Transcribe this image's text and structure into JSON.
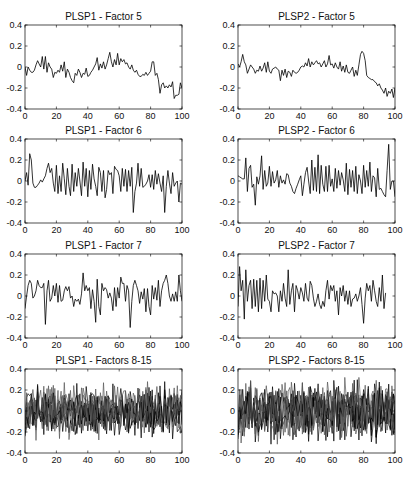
{
  "figure": {
    "layout": {
      "rows": 4,
      "cols": 2
    },
    "line_color": "#000000",
    "axis_color": "#000000"
  },
  "chart_data": [
    {
      "type": "line",
      "title": "PLSP1 - Factor 5",
      "xlabel": "",
      "ylabel": "",
      "xlim": [
        0,
        100
      ],
      "ylim": [
        -0.4,
        0.4
      ],
      "xticks": [
        0,
        20,
        40,
        60,
        80,
        100
      ],
      "yticks": [
        0.4,
        0.2,
        0,
        -0.2,
        -0.4
      ],
      "grid": false,
      "series": [
        {
          "name": "Factor 5",
          "x_step": 1,
          "values": [
            0,
            -0.08,
            0,
            -0.03,
            -0.05,
            -0.05,
            -0.03,
            0.02,
            0.06,
            0.03,
            0,
            0.1,
            -0.02,
            0.1,
            -0.05,
            0.04,
            0,
            -0.02,
            -0.1,
            -0.05,
            -0.06,
            -0.03,
            -0.05,
            0.02,
            -0.04,
            0.05,
            -0.1,
            -0.02,
            -0.05,
            -0.1,
            -0.13,
            -0.15,
            -0.06,
            -0.08,
            -0.02,
            -0.05,
            -0.1,
            -0.06,
            -0.07,
            -0.01,
            -0.09,
            -0.08,
            -0.05,
            -0.03,
            0,
            0.03,
            0.09,
            -0.03,
            0.03,
            -0.01,
            0.05,
            -0.02,
            0.02,
            0.08,
            0.14,
            0.05,
            0,
            0.07,
            0.02,
            0.13,
            0.02,
            0.08,
            0.05,
            0.07,
            0.03,
            0.04,
            0,
            -0.02,
            0.02,
            -0.03,
            -0.05,
            -0.03,
            -0.07,
            -0.09,
            -0.09,
            -0.07,
            -0.08,
            -0.05,
            -0.08,
            -0.06,
            -0.04,
            0.05,
            0.05,
            -0.08,
            -0.06,
            -0.12,
            -0.25,
            -0.17,
            -0.15,
            -0.2,
            -0.18,
            -0.2,
            -0.17,
            -0.19,
            -0.14,
            -0.3,
            -0.27,
            -0.27,
            -0.26,
            -0.15,
            -0.2
          ]
        }
      ]
    },
    {
      "type": "line",
      "title": "PLSP2 - Factor 5",
      "xlabel": "",
      "ylabel": "",
      "xlim": [
        0,
        100
      ],
      "ylim": [
        -0.4,
        0.4
      ],
      "xticks": [
        0,
        20,
        40,
        60,
        80,
        100
      ],
      "yticks": [
        0.4,
        0.2,
        0,
        -0.2,
        -0.4
      ],
      "grid": false,
      "series": [
        {
          "name": "Factor 5",
          "x_step": 1,
          "values": [
            0.03,
            0,
            0.05,
            0.12,
            0.05,
            0.02,
            -0.06,
            -0.02,
            0.02,
            0,
            -0.02,
            -0.06,
            -0.03,
            -0.04,
            0.01,
            -0.04,
            -0.01,
            0.04,
            -0.05,
            0.05,
            -0.04,
            -0.06,
            -0.02,
            -0.01,
            0,
            -0.02,
            -0.03,
            -0.13,
            -0.03,
            -0.08,
            -0.02,
            -0.1,
            -0.04,
            -0.05,
            -0.09,
            -0.03,
            -0.05,
            -0.06,
            -0.05,
            -0.03,
            0,
            0.01,
            0,
            0.04,
            0.01,
            0.08,
            0,
            0.05,
            0.02,
            0.04,
            0.06,
            0.03,
            0.04,
            0,
            0.03,
            0.06,
            0,
            0.03,
            0.11,
            0.02,
            0.03,
            -0.01,
            0.04,
            0,
            -0.02,
            0.05,
            -0.04,
            0.01,
            -0.05,
            0.02,
            -0.05,
            -0.06,
            -0.03,
            0,
            -0.09,
            -0.03,
            -0.08,
            0.02,
            0.12,
            0.15,
            0.13,
            0.06,
            -0.08,
            -0.1,
            -0.11,
            -0.12,
            -0.12,
            -0.14,
            -0.15,
            -0.18,
            -0.16,
            -0.2,
            -0.22,
            -0.25,
            -0.2,
            -0.28,
            -0.23,
            -0.25,
            -0.21,
            -0.29,
            -0.2
          ]
        }
      ]
    },
    {
      "type": "line",
      "title": "PLSP1 - Factor 6",
      "xlabel": "",
      "ylabel": "",
      "xlim": [
        0,
        100
      ],
      "ylim": [
        -0.4,
        0.4
      ],
      "xticks": [
        0,
        20,
        40,
        60,
        80,
        100
      ],
      "yticks": [
        0.4,
        0.2,
        0,
        -0.2,
        -0.4
      ],
      "grid": false,
      "series": [
        {
          "name": "Factor 6",
          "x_step": 1,
          "values": [
            0,
            0.08,
            -0.04,
            0.26,
            0.2,
            -0.02,
            -0.06,
            -0.06,
            -0.04,
            -0.02,
            0.01,
            -0.01,
            0.02,
            0.05,
            0.12,
            0.17,
            0.08,
            0.12,
            -0.02,
            -0.1,
            0.15,
            -0.12,
            0.05,
            -0.1,
            0.17,
            0.02,
            -0.13,
            0.12,
            -0.05,
            -0.14,
            0.16,
            -0.1,
            0.08,
            -0.05,
            0.12,
            0,
            -0.14,
            0.18,
            -0.05,
            0.12,
            -0.15,
            0.1,
            -0.08,
            0.16,
            0.02,
            -0.05,
            -0.14,
            0.13,
            0.08,
            -0.1,
            0.1,
            -0.16,
            -0.08,
            0.1,
            0.06,
            0.08,
            -0.12,
            0.14,
            0.11,
            0.1,
            0.05,
            -0.1,
            0.12,
            -0.05,
            0.11,
            -0.1,
            0.1,
            -0.05,
            0.13,
            -0.3,
            -0.1,
            -0.02,
            0.17,
            -0.05,
            0.12,
            -0.06,
            -0.05,
            -0.03,
            0,
            0.06,
            -0.06,
            0.06,
            -0.08,
            0.1,
            -0.03,
            0.07,
            -0.02,
            -0.1,
            0.05,
            -0.3,
            -0.05,
            0.1,
            -0.02,
            -0.12,
            0.08,
            -0.05,
            -0.02,
            0,
            -0.2,
            -0.02,
            -0.03
          ]
        }
      ]
    },
    {
      "type": "line",
      "title": "PLSP2 - Factor 6",
      "xlabel": "",
      "ylabel": "",
      "xlim": [
        0,
        100
      ],
      "ylim": [
        -0.4,
        0.4
      ],
      "xticks": [
        0,
        20,
        40,
        60,
        80,
        100
      ],
      "yticks": [
        0.4,
        0.2,
        0,
        -0.2,
        -0.4
      ],
      "grid": false,
      "series": [
        {
          "name": "Factor 6",
          "x_step": 1,
          "values": [
            0.05,
            0.04,
            0.03,
            0.02,
            0.02,
            0.22,
            -0.1,
            0.12,
            0.15,
            -0.06,
            -0.03,
            -0.23,
            0.04,
            -0.03,
            0.05,
            0.24,
            -0.08,
            0.1,
            -0.05,
            -0.02,
            0.14,
            -0.05,
            0.09,
            -0.02,
            0.01,
            0.1,
            -0.06,
            0.05,
            -0.02,
            0.01,
            -0.03,
            0.07,
            0.06,
            -0.02,
            -0.05,
            -0.1,
            -0.12,
            -0.07,
            -0.03,
            0.01,
            0.05,
            -0.14,
            -0.03,
            0.08,
            0.13,
            0,
            -0.12,
            0.2,
            -0.09,
            0.13,
            -0.1,
            0.25,
            -0.12,
            0.15,
            -0.03,
            -0.1,
            0.14,
            -0.1,
            0.15,
            -0.05,
            0.02,
            -0.1,
            0.12,
            -0.07,
            0.1,
            -0.04,
            0.08,
            0.01,
            -0.1,
            0.17,
            -0.13,
            0.11,
            -0.06,
            0.1,
            -0.1,
            0.14,
            -0.12,
            0.06,
            0,
            -0.12,
            0.15,
            -0.06,
            0.1,
            -0.05,
            0.18,
            -0.1,
            0.05,
            0.03,
            -0.15,
            0.12,
            -0.08,
            -0.07,
            -0.1,
            -0.13,
            -0.15,
            0.1,
            0.35,
            -0.08,
            0,
            0,
            -0.15
          ]
        }
      ]
    },
    {
      "type": "line",
      "title": "PLSP1 - Factor 7",
      "xlabel": "",
      "ylabel": "",
      "xlim": [
        0,
        100
      ],
      "ylim": [
        -0.4,
        0.4
      ],
      "xticks": [
        0,
        20,
        40,
        60,
        80,
        100
      ],
      "yticks": [
        0.4,
        0.2,
        0,
        -0.2,
        -0.4
      ],
      "grid": false,
      "series": [
        {
          "name": "Factor 7",
          "x_step": 1,
          "values": [
            -0.12,
            0,
            0.1,
            0.15,
            0.12,
            -0.02,
            0,
            0.05,
            0.15,
            0.1,
            0.08,
            0.08,
            0.12,
            -0.27,
            0.05,
            0.15,
            -0.05,
            -0.02,
            0.1,
            0,
            0.12,
            -0.06,
            0.1,
            -0.05,
            -0.04,
            0.05,
            0.09,
            0.05,
            0.09,
            -0.02,
            0,
            -0.1,
            -0.03,
            -0.05,
            -0.03,
            -0.08,
            0.02,
            0.22,
            0.05,
            0.1,
            0.05,
            0.08,
            -0.12,
            0.06,
            -0.05,
            -0.25,
            0.16,
            -0.1,
            -0.18,
            0.12,
            0.05,
            0.08,
            0.06,
            -0.02,
            0.03,
            -0.02,
            -0.14,
            0.08,
            -0.1,
            0.08,
            -0.02,
            0.18,
            0.12,
            0.12,
            -0.05,
            0.1,
            0.05,
            -0.3,
            -0.05,
            0.1,
            0.15,
            0.1,
            0.05,
            -0.07,
            0.04,
            -0.03,
            0.07,
            -0.15,
            0.07,
            -0.1,
            -0.18,
            0.1,
            -0.03,
            0.08,
            -0.04,
            0.15,
            -0.1,
            0.05,
            0.12,
            0.15,
            0.2,
            0.12,
            0,
            -0.05,
            0.02,
            -0.05,
            0.04,
            -0.05,
            0.2,
            0.05,
            -0.05
          ]
        }
      ]
    },
    {
      "type": "line",
      "title": "PLSP2 - Factor 7",
      "xlabel": "",
      "ylabel": "",
      "xlim": [
        0,
        100
      ],
      "ylim": [
        -0.4,
        0.4
      ],
      "xticks": [
        0,
        20,
        40,
        60,
        80,
        100
      ],
      "yticks": [
        0.4,
        0.2,
        0,
        -0.2,
        -0.4
      ],
      "grid": false,
      "series": [
        {
          "name": "Factor 7",
          "x_step": 1,
          "values": [
            -0.1,
            0.28,
            0.05,
            0.15,
            -0.22,
            0.25,
            -0.05,
            0.1,
            0.15,
            -0.12,
            0.16,
            -0.1,
            0.15,
            -0.15,
            0.17,
            -0.12,
            0.15,
            -0.05,
            0.2,
            -0.03,
            -0.05,
            -0.15,
            0.05,
            0.02,
            0.03,
            0,
            -0.15,
            0.05,
            -0.05,
            0.12,
            -0.02,
            -0.1,
            0.25,
            -0.08,
            0.05,
            0.12,
            -0.15,
            0.1,
            0.05,
            -0.03,
            0.08,
            0.03,
            -0.05,
            0.12,
            -0.02,
            -0.05,
            0.14,
            0.1,
            -0.02,
            -0.1,
            -0.05,
            0.02,
            -0.08,
            -0.12,
            -0.05,
            -0.1,
            0.05,
            0.15,
            -0.03,
            0.1,
            0.05,
            0.1,
            -0.05,
            0.05,
            -0.18,
            0.08,
            0,
            0.1,
            -0.05,
            0.05,
            -0.08,
            0.05,
            -0.1,
            -0.03,
            -0.02,
            0.02,
            -0.05,
            0,
            0.08,
            -0.08,
            -0.26,
            -0.02,
            0.12,
            0.05,
            0.1,
            -0.05,
            0.15,
            0.05,
            -0.05,
            -0.1,
            0.08,
            -0.05,
            0.2,
            -0.12,
            0.03
          ]
        }
      ]
    },
    {
      "type": "line",
      "title": "PLSP1 - Factors 8-15",
      "xlabel": "",
      "ylabel": "",
      "xlim": [
        0,
        100
      ],
      "ylim": [
        -0.4,
        0.4
      ],
      "xticks": [
        0,
        20,
        40,
        60,
        80,
        100
      ],
      "yticks": [
        0.4,
        0.2,
        0,
        -0.2,
        -0.4
      ],
      "grid": false,
      "series_count": 8,
      "series_names": [
        "Factor 8",
        "Factor 9",
        "Factor 10",
        "Factor 11",
        "Factor 12",
        "Factor 13",
        "Factor 14",
        "Factor 15"
      ],
      "amplitude_range": [
        -0.28,
        0.28
      ],
      "note": "8 overlapping noisy series spanning approx -0.25 to 0.25"
    },
    {
      "type": "line",
      "title": "PLSP2 - Factors 8-15",
      "xlabel": "",
      "ylabel": "",
      "xlim": [
        0,
        100
      ],
      "ylim": [
        -0.4,
        0.4
      ],
      "xticks": [
        0,
        20,
        40,
        60,
        80,
        100
      ],
      "yticks": [
        0.4,
        0.2,
        0,
        -0.2,
        -0.4
      ],
      "grid": false,
      "series_count": 8,
      "series_names": [
        "Factor 8",
        "Factor 9",
        "Factor 10",
        "Factor 11",
        "Factor 12",
        "Factor 13",
        "Factor 14",
        "Factor 15"
      ],
      "amplitude_range": [
        -0.32,
        0.32
      ],
      "note": "8 overlapping noisy series spanning approx -0.3 to 0.3"
    }
  ]
}
